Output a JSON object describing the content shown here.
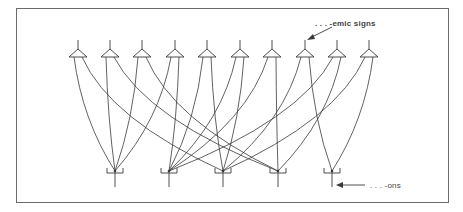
{
  "diagram": {
    "title": "",
    "labels": {
      "emic_signs": ". . . -emic signs",
      "ons": ". . . -ons"
    },
    "colors": {
      "line": "#3a3a3a",
      "frame": "#6b6b6b",
      "text": "#444444",
      "background": "#ffffff"
    },
    "top_nodes": [
      {
        "id": "t1",
        "x": 78
      },
      {
        "id": "t2",
        "x": 110
      },
      {
        "id": "t3",
        "x": 142
      },
      {
        "id": "t4",
        "x": 175
      },
      {
        "id": "t5",
        "x": 207
      },
      {
        "id": "t6",
        "x": 240
      },
      {
        "id": "t7",
        "x": 272
      },
      {
        "id": "t8",
        "x": 305
      },
      {
        "id": "t9",
        "x": 337
      },
      {
        "id": "t10",
        "x": 369
      }
    ],
    "bottom_nodes": [
      {
        "id": "b1",
        "x": 115
      },
      {
        "id": "b2",
        "x": 169
      },
      {
        "id": "b3",
        "x": 223
      },
      {
        "id": "b4",
        "x": 278
      },
      {
        "id": "b5",
        "x": 332
      }
    ],
    "edges": [
      [
        "t1",
        "b1"
      ],
      [
        "t1",
        "b3"
      ],
      [
        "t2",
        "b1"
      ],
      [
        "t2",
        "b4"
      ],
      [
        "t3",
        "b1"
      ],
      [
        "t3",
        "b4"
      ],
      [
        "t4",
        "b1"
      ],
      [
        "t4",
        "b2"
      ],
      [
        "t5",
        "b2"
      ],
      [
        "t5",
        "b3"
      ],
      [
        "t6",
        "b2"
      ],
      [
        "t6",
        "b3"
      ],
      [
        "t7",
        "b2"
      ],
      [
        "t7",
        "b4"
      ],
      [
        "t8",
        "b3"
      ],
      [
        "t8",
        "b5"
      ],
      [
        "t9",
        "b2"
      ],
      [
        "t9",
        "b4"
      ],
      [
        "t10",
        "b3"
      ],
      [
        "t10",
        "b5"
      ]
    ]
  }
}
